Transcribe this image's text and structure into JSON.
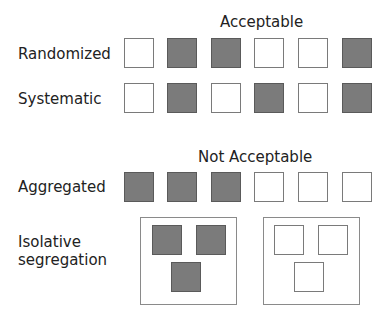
{
  "sections": {
    "acceptable": {
      "title": "Acceptable"
    },
    "not_acceptable": {
      "title": "Not Acceptable"
    }
  },
  "colors": {
    "filled": "#7b7b7b",
    "filled_border": "#5a5a5a",
    "empty_border": "#7a7a7a"
  },
  "rows": [
    {
      "label": "Randomized",
      "pattern": [
        0,
        1,
        1,
        0,
        0,
        1
      ]
    },
    {
      "label": "Systematic",
      "pattern": [
        0,
        1,
        0,
        1,
        0,
        1
      ]
    },
    {
      "label": "Aggregated",
      "pattern": [
        1,
        1,
        1,
        0,
        0,
        0
      ]
    }
  ],
  "isolative": {
    "label_line1": "Isolative",
    "label_line2": "segregation",
    "containers": [
      {
        "filled": true
      },
      {
        "filled": false
      }
    ]
  }
}
